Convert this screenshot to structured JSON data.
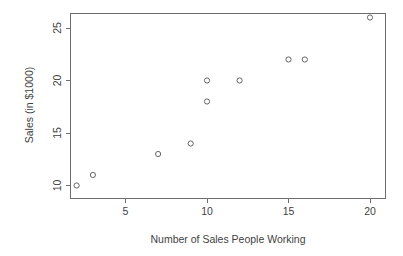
{
  "chart_data": {
    "type": "scatter",
    "title": "",
    "xlabel": "Number of Sales People Working",
    "ylabel": "Sales (in $1000)",
    "xlim": [
      1.2,
      21.0
    ],
    "ylim": [
      9.2,
      26.8
    ],
    "xticks": [
      5,
      10,
      15,
      20
    ],
    "yticks": [
      10,
      15,
      20,
      25
    ],
    "xticklabels": [
      "5",
      "10",
      "15",
      "20"
    ],
    "yticklabels": [
      "10",
      "15",
      "20",
      "25"
    ],
    "grid": false,
    "legend": null,
    "marker": "open-circle",
    "marker_color": "#555555",
    "x": [
      2,
      3,
      7,
      9,
      10,
      10,
      12,
      15,
      16,
      20
    ],
    "y": [
      10,
      11,
      13,
      14,
      18,
      20,
      20,
      22,
      22,
      26
    ],
    "points": [
      {
        "x": 2,
        "y": 10
      },
      {
        "x": 3,
        "y": 11
      },
      {
        "x": 7,
        "y": 13
      },
      {
        "x": 9,
        "y": 14
      },
      {
        "x": 10,
        "y": 18
      },
      {
        "x": 10,
        "y": 20
      },
      {
        "x": 12,
        "y": 20
      },
      {
        "x": 15,
        "y": 22
      },
      {
        "x": 16,
        "y": 22
      },
      {
        "x": 20,
        "y": 26
      }
    ]
  },
  "axes": {
    "x_title": "Number of Sales People Working",
    "y_title": "Sales (in $1000)",
    "x_tick_labels": [
      "5",
      "10",
      "15",
      "20"
    ],
    "y_tick_labels": [
      "10",
      "15",
      "20",
      "25"
    ]
  },
  "colors": {
    "background": "#ffffff",
    "axis": "#6e6e6e",
    "marker": "#555555",
    "text": "#3f3f3f"
  }
}
